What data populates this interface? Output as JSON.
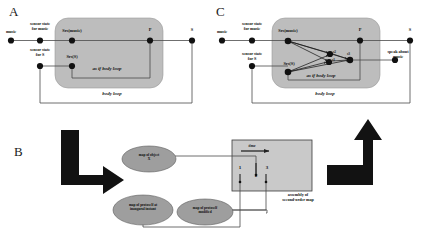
{
  "figure": {
    "background_color": "#ffffff",
    "brain_box_color": "#bdbdbd",
    "ellipse_color": "#9e9e9e",
    "map_box_color": "#c9c9c9",
    "line_color": "#555555",
    "node_color": "#111111",
    "arrow_color": "#121212"
  },
  "panels": {
    "a": {
      "letter": "A",
      "nodes": [
        {
          "id": "music",
          "label": "music"
        },
        {
          "id": "sensor-state-music",
          "label": "sensor state\nfor music"
        },
        {
          "id": "srs-music",
          "label": "Srs(music)"
        },
        {
          "id": "p",
          "label": "P"
        },
        {
          "id": "s",
          "label": "S"
        },
        {
          "id": "sensor-state-s",
          "label": "sensor state\nfor S"
        },
        {
          "id": "srs-s",
          "label": "Srs(S)"
        }
      ],
      "node_labels": {
        "music": "music",
        "sensor_state_music_line1": "sensor state",
        "sensor_state_music_line2": "for music",
        "srs_music": "Srs(music)",
        "p": "P",
        "s": "S",
        "sensor_state_s_line1": "sensor state",
        "sensor_state_s_line2": "for S",
        "srs_s": "Srs(S)"
      },
      "loops": {
        "as_if_body_loop": "as if body loop",
        "body_loop": "body loop"
      }
    },
    "c": {
      "letter": "C",
      "node_labels": {
        "music": "music",
        "sensor_state_music_line1": "sensor state",
        "sensor_state_music_line2": "for music",
        "srs_music": "Srs(music)",
        "p": "P",
        "s": "S",
        "sensor_state_s_line1": "sensor state",
        "sensor_state_s_line2": "for S",
        "srs_s": "Srs(S)",
        "s2": "s2",
        "s1": "s1",
        "s3": "s3",
        "speak_line1": "speak about",
        "speak_line2": "music"
      },
      "loops": {
        "as_if_body_loop": "as if body loop",
        "body_loop": "body loop"
      }
    },
    "b": {
      "letter": "B",
      "ellipses": [
        {
          "id": "map-object-x",
          "line1": "map of object",
          "line2": "X"
        },
        {
          "id": "map-protoself-inaugural",
          "line1": "map of protoself at",
          "line2": "inaugural instant"
        },
        {
          "id": "map-protoself-modified",
          "line1": "map of protoself",
          "line2": "modified"
        }
      ],
      "time_label": "time",
      "tick_labels": [
        "1",
        "2",
        "3"
      ],
      "caption_line1": "assembly of",
      "caption_line2": "second-order map"
    }
  }
}
